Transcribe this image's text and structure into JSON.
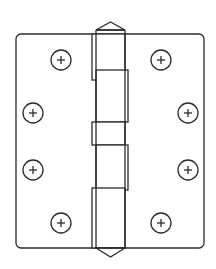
{
  "diagram": {
    "style": "line drawing",
    "stroke_color": "#2b2b2b",
    "background_color": "#ffffff",
    "plate": {
      "x": 16,
      "y": 34,
      "width": 188,
      "height": 214,
      "corner_radius": 5
    },
    "pin": {
      "x": 96,
      "width": 29,
      "top_tip_y": 22,
      "top_base_y": 30,
      "bottom_base_y": 248,
      "bottom_tip_y": 257
    },
    "knuckles": [
      {
        "side": "left",
        "x": 92,
        "y": 34,
        "width": 33,
        "height": 46
      },
      {
        "side": "right",
        "x": 96,
        "y": 70,
        "width": 32,
        "height": 52
      },
      {
        "side": "left",
        "x": 92,
        "y": 122,
        "width": 33,
        "height": 23
      },
      {
        "side": "right",
        "x": 96,
        "y": 145,
        "width": 32,
        "height": 45
      },
      {
        "side": "left",
        "x": 92,
        "y": 188,
        "width": 33,
        "height": 60
      }
    ],
    "screws": [
      {
        "id": "screw-left-top",
        "cx": 61,
        "cy": 60,
        "r": 10,
        "icon": "phillips-plus"
      },
      {
        "id": "screw-left-upper-mid",
        "cx": 33,
        "cy": 113,
        "r": 10,
        "icon": "phillips-plus"
      },
      {
        "id": "screw-left-lower-mid",
        "cx": 33,
        "cy": 170,
        "r": 10,
        "icon": "phillips-plus"
      },
      {
        "id": "screw-left-bottom",
        "cx": 61,
        "cy": 223,
        "r": 10,
        "icon": "phillips-plus"
      },
      {
        "id": "screw-right-top",
        "cx": 161,
        "cy": 60,
        "r": 10,
        "icon": "phillips-plus"
      },
      {
        "id": "screw-right-upper-mid",
        "cx": 188,
        "cy": 113,
        "r": 10,
        "icon": "phillips-plus"
      },
      {
        "id": "screw-right-lower-mid",
        "cx": 188,
        "cy": 170,
        "r": 10,
        "icon": "phillips-plus"
      },
      {
        "id": "screw-right-bottom",
        "cx": 161,
        "cy": 223,
        "r": 10,
        "icon": "phillips-plus"
      }
    ]
  }
}
